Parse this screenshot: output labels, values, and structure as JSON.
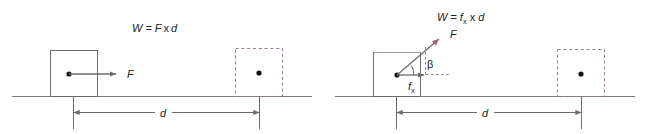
{
  "figure": {
    "background": "#ffffff",
    "width": 647,
    "height": 134
  },
  "colors": {
    "line": "#6b6b6b",
    "ground": "#7a7a7a",
    "solid_box": "#6b6b6b",
    "dashed_box": "#9b7f96",
    "accent": "#b05a7a",
    "text": "#222222",
    "dot": "#111111"
  },
  "panels": [
    {
      "id": "panel-left",
      "formula": {
        "text": "W = F x d",
        "parts": {
          "work": "W",
          "equals": "=",
          "force": "F",
          "times": "x",
          "distance": "d"
        }
      },
      "solid_box": {
        "label": "object-initial-position"
      },
      "dashed_box": {
        "label": "object-final-position"
      },
      "force_arrow": {
        "label": "F",
        "direction": "horizontal-right"
      },
      "dimension": {
        "label": "d"
      }
    },
    {
      "id": "panel-right",
      "formula": {
        "text": "W = fx x d",
        "parts": {
          "work": "W",
          "equals": "=",
          "force": "f",
          "force_sub": "x",
          "times": "x",
          "distance": "d"
        }
      },
      "solid_box": {
        "label": "object-initial-position"
      },
      "dashed_box": {
        "label": "object-final-position"
      },
      "force_arrow": {
        "label": "F",
        "direction": "diagonal-up-right"
      },
      "component_arrow": {
        "label": "f",
        "label_sub": "x",
        "direction": "horizontal-right"
      },
      "angle": {
        "label": "β"
      },
      "dimension": {
        "label": "d"
      }
    }
  ]
}
